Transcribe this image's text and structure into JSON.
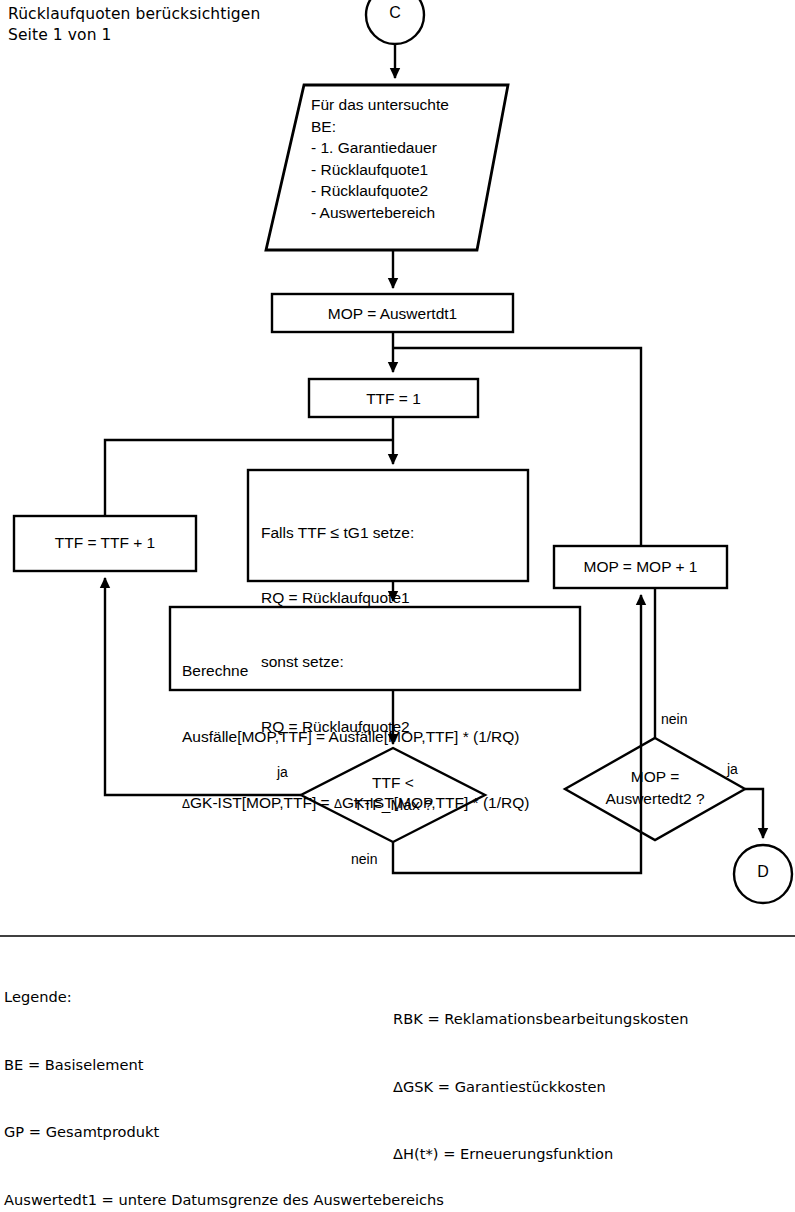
{
  "header": {
    "line1": "Rücklaufquoten berücksichtigen",
    "line2": "Seite 1 von 1"
  },
  "connectors": {
    "entry_label": "C",
    "exit_label": "D"
  },
  "nodes": {
    "input_be": {
      "shape": "parallelogram",
      "text": "Für das untersuchte\nBE:\n- 1. Garantiedauer\n- Rücklaufquote1\n- Rücklaufquote2\n- Auswertebereich"
    },
    "mop_init": {
      "shape": "process",
      "text": "MOP = Auswertdt1"
    },
    "ttf_init": {
      "shape": "process",
      "text": "TTF = 1"
    },
    "ttf_incr": {
      "shape": "process",
      "text": "TTF = TTF + 1"
    },
    "mop_incr": {
      "shape": "process",
      "text": "MOP = MOP + 1"
    },
    "rq_select": {
      "shape": "process",
      "line1_a": "Falls TTF ",
      "line1_leq": "≤",
      "line1_b": " tG1 setze:",
      "line2": "RQ = Rücklaufquote1",
      "line3": "sonst setze:",
      "line4": "RQ = Rücklaufquote2"
    },
    "berechne": {
      "shape": "process",
      "line1": "Berechne",
      "line2": "Ausfälle[MOP,TTF] = Ausfälle[MOP,TTF] * (1/RQ)",
      "line3_delta": "Δ",
      "line3_rest": "GK-IST[MOP,TTF] = ",
      "line3_delta2": "Δ",
      "line3_rest2": "GK-IST[MOP,TTF] * (1/RQ)"
    },
    "ttf_check": {
      "shape": "decision",
      "text": "TTF <\nTTF_Max ?"
    },
    "mop_check": {
      "shape": "decision",
      "text": "MOP =\nAuswertedt2 ?"
    }
  },
  "edge_labels": {
    "ttf_yes": "ja",
    "ttf_no": "nein",
    "mop_no": "nein",
    "mop_yes": "ja"
  },
  "legend": {
    "title": "Legende:",
    "left": [
      "BE = Basiselement",
      "GP = Gesamtprodukt",
      "Auswertedt1 = untere Datumsgrenze des Auswertebereichs"
    ],
    "right": [
      "RBK = Reklamationsbearbeitungskosten",
      "ΔGSK = Garantiestückkosten",
      "ΔH(t*) = Erneuerungsfunktion"
    ]
  },
  "colors": {
    "stroke": "#000000",
    "fill": "#ffffff",
    "background": "#ffffff"
  }
}
